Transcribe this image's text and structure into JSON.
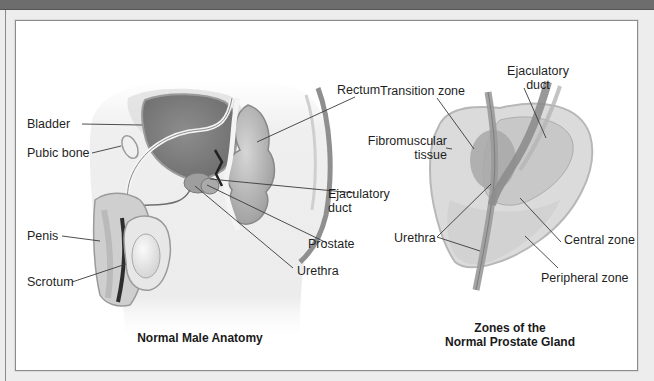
{
  "figure": {
    "left_diagram": {
      "caption": "Normal Male Anatomy",
      "labels": {
        "bladder": "Bladder",
        "pubic_bone": "Pubic bone",
        "penis": "Penis",
        "scrotum": "Scrotum",
        "rectum": "Rectum",
        "ejaculatory_duct_line1": "Ejaculatory",
        "ejaculatory_duct_line2": "duct",
        "prostate": "Prostate",
        "urethra": "Urethra"
      }
    },
    "right_diagram": {
      "caption_line1": "Zones of the",
      "caption_line2": "Normal Prostate Gland",
      "labels": {
        "ejaculatory_duct_line1": "Ejaculatory",
        "ejaculatory_duct_line2": "duct",
        "transition_zone": "Transition zone",
        "fibromuscular_line1": "Fibromuscular",
        "fibromuscular_line2": "tissue",
        "urethra": "Urethra",
        "central_zone": "Central zone",
        "peripheral_zone": "Peripheral zone"
      }
    }
  },
  "colors": {
    "topbar": "#6d6d6d",
    "frame": "#ededed",
    "panel": "#ffffff",
    "leader_line": "#3a3a3a",
    "tissue_light": "#e6e6e6",
    "tissue_mid": "#bdbdbd",
    "tissue_dark": "#8e8e8e"
  }
}
